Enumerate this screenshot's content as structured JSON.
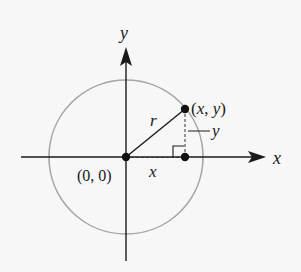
{
  "diagram": {
    "colors": {
      "background": "#f7f7f7",
      "axis": "#1a1a1a",
      "circle": "#a6a6a6",
      "point": "#111111"
    },
    "geometry": {
      "center": [
        126,
        157
      ],
      "radius": 77,
      "point": [
        185,
        109
      ],
      "foot": [
        185,
        157
      ]
    },
    "labels": {
      "y_axis": "y",
      "x_axis": "x",
      "origin": "(0, 0)",
      "point": "(x, y)",
      "radius": "r",
      "vertical_leg": "y",
      "horizontal_leg": "x"
    }
  }
}
